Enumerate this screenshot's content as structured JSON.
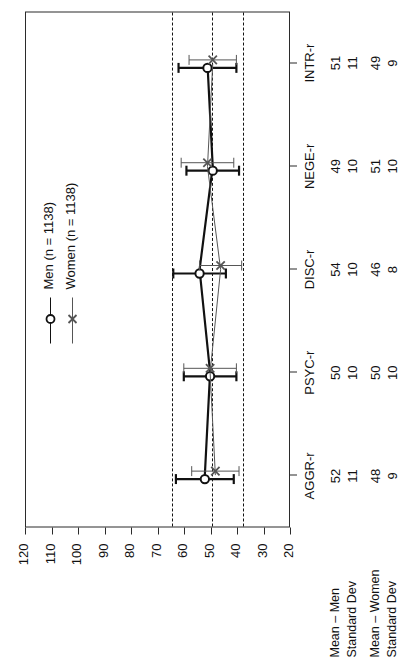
{
  "chart_data": {
    "type": "line",
    "title": "",
    "subtitle": "",
    "xlabel": "",
    "ylabel": "",
    "categories": [
      "AGGR-r",
      "PSYC-r",
      "DISC-r",
      "NEGE-r",
      "INTR-r"
    ],
    "series": [
      {
        "name": "Men (n = 1138)",
        "marker": "circle",
        "values": [
          52,
          50,
          54,
          49,
          51
        ],
        "errors": [
          11,
          10,
          10,
          10,
          11
        ],
        "color": "#111111",
        "linewidth": 2.2
      },
      {
        "name": "Women (n = 1138)",
        "marker": "cross",
        "values": [
          48,
          50,
          46,
          51,
          49
        ],
        "errors": [
          9,
          10,
          8,
          10,
          9
        ],
        "color": "#555555",
        "linewidth": 1.0
      }
    ],
    "error_bar_note": "error bars span mean ± 1 standard deviation",
    "yticks": [
      120,
      110,
      100,
      90,
      80,
      70,
      60,
      50,
      40,
      30,
      20
    ],
    "ylim": [
      20,
      120
    ],
    "grid": false,
    "reference_lines": [
      65,
      50,
      38
    ],
    "legend_position": "top-left (rotated figure: upper middle)",
    "legend": [
      "Men (n = 1138)",
      "Women (n = 1138)"
    ],
    "table": {
      "row_labels": [
        "Mean – Men",
        "Standard Dev",
        "Mean – Women",
        "Standard Dev"
      ],
      "rows": [
        [
          "52",
          "50",
          "54",
          "49",
          "51"
        ],
        [
          "11",
          "10",
          "10",
          "10",
          "11"
        ],
        [
          "48",
          "50",
          "46",
          "51",
          "49"
        ],
        [
          "9",
          "10",
          "8",
          "10",
          "9"
        ]
      ]
    }
  }
}
